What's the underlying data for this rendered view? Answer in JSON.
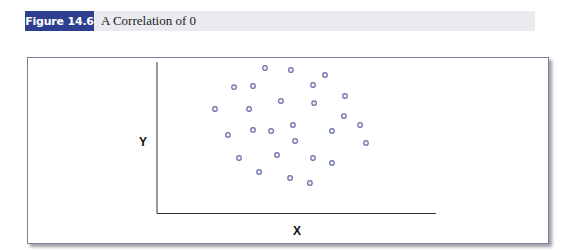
{
  "caption": {
    "figure_label": "Figure 14.6",
    "title": "A Correlation of 0"
  },
  "colors": {
    "label_bg": "#2f3f8f",
    "caption_bg": "#e9ebef",
    "point_stroke": "#6a6fa8",
    "axis": "#333333"
  },
  "chart_data": {
    "type": "scatter",
    "title": "A Correlation of 0",
    "xlabel": "X",
    "ylabel": "Y",
    "xlim": [
      0,
      10
    ],
    "ylim": [
      0,
      10
    ],
    "grid": false,
    "ticks": false,
    "legend": null,
    "points": [
      {
        "x": 3.87,
        "y": 9.6
      },
      {
        "x": 4.8,
        "y": 9.47
      },
      {
        "x": 6.02,
        "y": 9.14
      },
      {
        "x": 2.76,
        "y": 8.34
      },
      {
        "x": 3.44,
        "y": 8.41
      },
      {
        "x": 5.59,
        "y": 8.48
      },
      {
        "x": 6.74,
        "y": 7.75
      },
      {
        "x": 2.08,
        "y": 6.89
      },
      {
        "x": 3.3,
        "y": 6.89
      },
      {
        "x": 4.44,
        "y": 7.42
      },
      {
        "x": 5.63,
        "y": 7.28
      },
      {
        "x": 6.7,
        "y": 6.42
      },
      {
        "x": 7.28,
        "y": 5.83
      },
      {
        "x": 4.87,
        "y": 5.83
      },
      {
        "x": 6.27,
        "y": 5.43
      },
      {
        "x": 2.54,
        "y": 5.17
      },
      {
        "x": 3.44,
        "y": 5.5
      },
      {
        "x": 4.09,
        "y": 5.43
      },
      {
        "x": 4.95,
        "y": 4.77
      },
      {
        "x": 7.49,
        "y": 4.64
      },
      {
        "x": 2.94,
        "y": 3.64
      },
      {
        "x": 4.3,
        "y": 3.84
      },
      {
        "x": 5.59,
        "y": 3.64
      },
      {
        "x": 6.27,
        "y": 3.31
      },
      {
        "x": 3.66,
        "y": 2.72
      },
      {
        "x": 4.77,
        "y": 2.32
      },
      {
        "x": 5.48,
        "y": 1.99
      }
    ]
  }
}
